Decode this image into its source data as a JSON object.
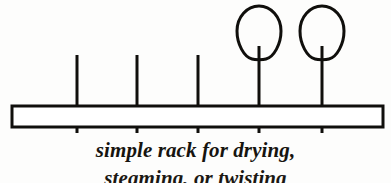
{
  "figure": {
    "background_color": "#fdfdfc",
    "ink_color": "#100f0c",
    "board": {
      "name": "rack board",
      "x": 12,
      "y": 106,
      "width": 371,
      "height": 21,
      "stroke_width": 3,
      "fill": "#ffffff"
    },
    "pegs": [
      {
        "id": "peg-1",
        "x": 77,
        "top_y": 55,
        "bottom_y": 133,
        "has_loop": false,
        "stroke_width": 3
      },
      {
        "id": "peg-2",
        "x": 137,
        "top_y": 55,
        "bottom_y": 133,
        "has_loop": false,
        "stroke_width": 3
      },
      {
        "id": "peg-3",
        "x": 198,
        "top_y": 55,
        "bottom_y": 133,
        "has_loop": false,
        "stroke_width": 3
      },
      {
        "id": "peg-4",
        "x": 259,
        "top_y": 46,
        "bottom_y": 133,
        "has_loop": true,
        "stroke_width": 3
      },
      {
        "id": "peg-5",
        "x": 322,
        "top_y": 46,
        "bottom_y": 133,
        "has_loop": true,
        "stroke_width": 3
      }
    ],
    "loops": [
      {
        "id": "loop-1",
        "center_x": 259,
        "top_y": 6,
        "bottom_y": 60,
        "half_width": 22,
        "stroke_width": 3
      },
      {
        "id": "loop-2",
        "center_x": 322,
        "top_y": 6,
        "bottom_y": 60,
        "half_width": 22,
        "stroke_width": 3
      }
    ]
  },
  "caption": {
    "line1": "simple rack for drying,",
    "line2": "steaming, or twisting"
  }
}
